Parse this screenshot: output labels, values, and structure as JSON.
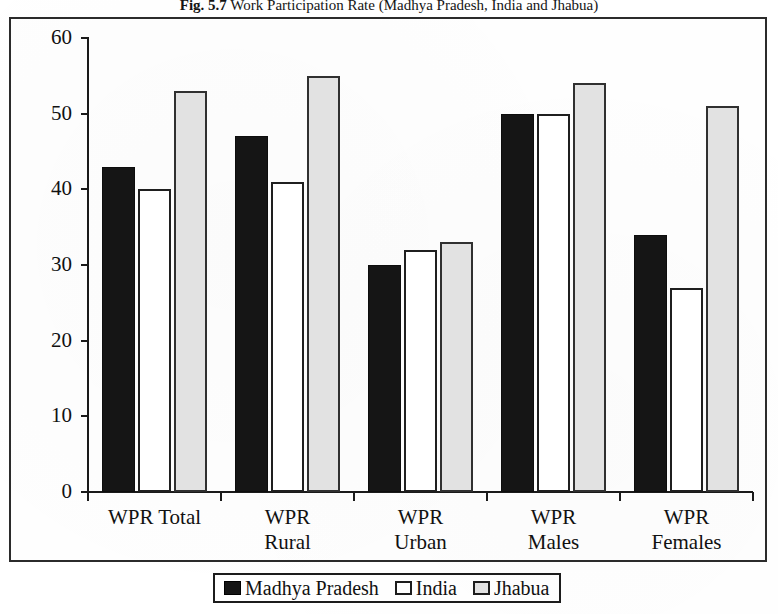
{
  "title": {
    "figure_number": "Fig. 5.7",
    "text": "Work Participation Rate (Madhya Pradesh, India and Jhabua)"
  },
  "chart_data": {
    "type": "bar",
    "title": "Fig. 5.7 Work Participation Rate (Madhya Pradesh, India and Jhabua)",
    "xlabel": "",
    "ylabel": "",
    "ylim": [
      0,
      60
    ],
    "grid": false,
    "legend_position": "bottom",
    "categories": [
      "WPR Total",
      "WPR Rural",
      "WPR Urban",
      "WPR Males",
      "WPR Females"
    ],
    "category_lines": [
      [
        "WPR Total"
      ],
      [
        "WPR",
        "Rural"
      ],
      [
        "WPR",
        "Urban"
      ],
      [
        "WPR",
        "Males"
      ],
      [
        "WPR",
        "Females"
      ]
    ],
    "series": [
      {
        "name": "Madhya Pradesh",
        "values": [
          43,
          47,
          30,
          50,
          34
        ],
        "color": "#151515",
        "style": "solid-black"
      },
      {
        "name": "India",
        "values": [
          40,
          41,
          32,
          50,
          27
        ],
        "color": "#ffffff",
        "style": "outline-white"
      },
      {
        "name": "Jhabua",
        "values": [
          53,
          55,
          33,
          54,
          51
        ],
        "color": "#e2e2e2",
        "style": "outline-grey"
      }
    ],
    "yticks": [
      0,
      10,
      20,
      30,
      40,
      50,
      60
    ],
    "ytick_labels": [
      "0",
      "10",
      "20",
      "30",
      "40",
      "50",
      "60"
    ]
  },
  "legend": {
    "entries": [
      {
        "label": "Madhya Pradesh"
      },
      {
        "label": "India"
      },
      {
        "label": "Jhabua"
      }
    ]
  }
}
